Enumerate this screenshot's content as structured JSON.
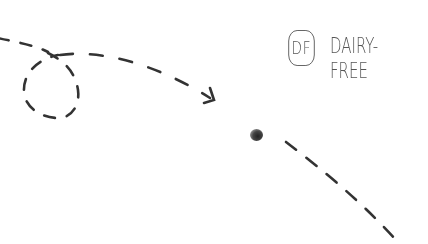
{
  "badge": {
    "abbreviation": "DF",
    "label": "DAIRY-FREE"
  },
  "decorations": {
    "path_color": "#333333",
    "text_color": "#555555",
    "icons": [
      "dashed-arrow-icon",
      "dashed-loop-icon",
      "ink-dot-icon",
      "dashed-trail-icon"
    ]
  }
}
